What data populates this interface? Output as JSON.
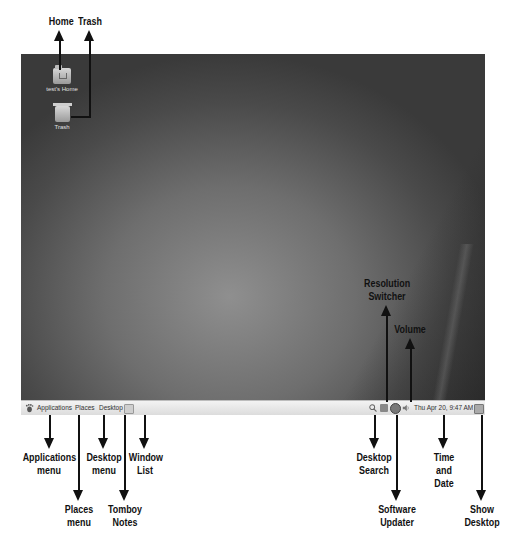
{
  "desktop": {
    "icons": [
      {
        "label": "test's Home",
        "icon": "home-folder-icon"
      },
      {
        "label": "Trash",
        "icon": "trash-icon"
      }
    ]
  },
  "panel": {
    "menus": [
      "Applications",
      "Places",
      "Desktop"
    ],
    "clock": "Thu Apr 20,  9:47 AM",
    "tray_icons": [
      "search-icon",
      "resolution-icon",
      "updater-icon",
      "volume-icon",
      "show-desktop-icon"
    ]
  },
  "annotations": {
    "home": "Home",
    "trash": "Trash",
    "resolution_1": "Resolution",
    "resolution_2": "Switcher",
    "volume": "Volume",
    "applications_1": "Applications",
    "applications_2": "menu",
    "places_1": "Places",
    "places_2": "menu",
    "desktop_1": "Desktop",
    "desktop_2": "menu",
    "tomboy_1": "Tomboy",
    "tomboy_2": "Notes",
    "windowlist_1": "Window",
    "windowlist_2": "List",
    "search_1": "Desktop",
    "search_2": "Search",
    "updater_1": "Software",
    "updater_2": "Updater",
    "time_1": "Time",
    "time_2": "and",
    "time_3": "Date",
    "showdesk_1": "Show",
    "showdesk_2": "Desktop"
  },
  "colors": {
    "panel_bg": "#e8e8e8",
    "desktop_center": "#8f8f8f",
    "desktop_edge": "#3a3a3a",
    "annotation": "#111111"
  }
}
